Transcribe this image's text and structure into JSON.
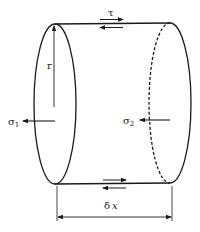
{
  "figure": {
    "labels": {
      "shear": "τ",
      "radius": "r",
      "sigma1_base": "σ",
      "sigma1_sub": "1",
      "sigma2_base": "σ",
      "sigma2_sub": "2",
      "length_delta": "δ",
      "length_var": "x"
    },
    "colors": {
      "stroke": "#1a1a1a",
      "background": "#ffffff"
    }
  }
}
